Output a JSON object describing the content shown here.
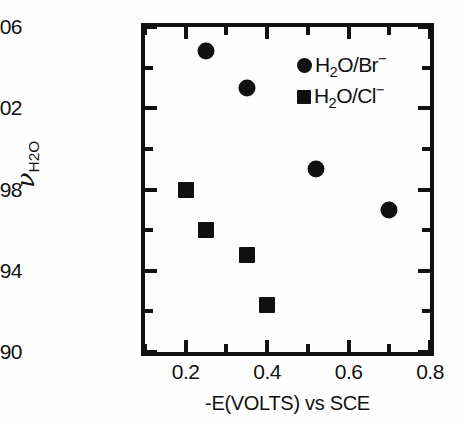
{
  "chart_data": {
    "type": "scatter",
    "title": "",
    "xlabel": "-E(VOLTS) vs SCE",
    "ylabel": "ν H2O",
    "xlim": [
      0.1,
      0.8
    ],
    "ylim": [
      3490,
      3506
    ],
    "grid": false,
    "legend_position": "top-right",
    "x_major_ticks": [
      0.2,
      0.4,
      0.6,
      0.8
    ],
    "x_minor_ticks": [
      0.1,
      0.3,
      0.5,
      0.7
    ],
    "x_tick_labels": [
      "0.2",
      "0.4",
      "0.6",
      "0.8"
    ],
    "y_major_ticks": [
      3490,
      3494,
      3498,
      3502,
      3506
    ],
    "y_minor_ticks": [
      3492,
      3496,
      3500,
      3504
    ],
    "y_tick_labels": [
      "3490",
      "3494",
      "3498",
      "3502",
      "3506"
    ],
    "series": [
      {
        "name": "H2O/Br-",
        "marker": "circle",
        "color": "#101010",
        "points": [
          {
            "x": 0.25,
            "y": 3504.8
          },
          {
            "x": 0.35,
            "y": 3503.0
          },
          {
            "x": 0.52,
            "y": 3499.0
          },
          {
            "x": 0.7,
            "y": 3497.0
          }
        ]
      },
      {
        "name": "H2O/Cl-",
        "marker": "square",
        "color": "#101010",
        "points": [
          {
            "x": 0.2,
            "y": 3498.0
          },
          {
            "x": 0.25,
            "y": 3496.0
          },
          {
            "x": 0.35,
            "y": 3494.8
          },
          {
            "x": 0.4,
            "y": 3492.3
          }
        ]
      }
    ]
  },
  "axes": {
    "x_title_text": "-E(VOLTS) vs SCE",
    "y_title_symbol": "ν",
    "y_title_sub": "H",
    "y_title_sub_num": "2",
    "y_title_sub_tail": "O"
  },
  "legend": {
    "items": [
      {
        "marker": "circle",
        "formula_head": "H",
        "formula_sub": "2",
        "formula_mid": "O/Br",
        "formula_sup": "−"
      },
      {
        "marker": "square",
        "formula_head": "H",
        "formula_sub": "2",
        "formula_mid": "O/Cl",
        "formula_sup": "−"
      }
    ]
  }
}
